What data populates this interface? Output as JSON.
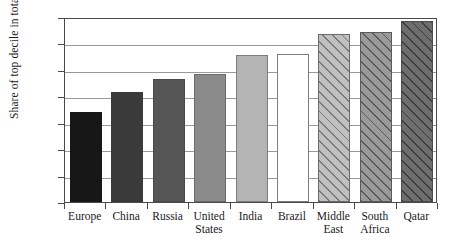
{
  "chart_data": {
    "type": "bar",
    "title": "",
    "xlabel": "",
    "ylabel": "Share of top decile in total income",
    "ylim": [
      0,
      70
    ],
    "ytick_labels": [
      "0%",
      "10%",
      "20%",
      "30%",
      "40%",
      "50%",
      "60%",
      "70%"
    ],
    "ytick_values": [
      0,
      10,
      20,
      30,
      40,
      50,
      60,
      70
    ],
    "grid": true,
    "legend": "none",
    "categories": [
      "Europe",
      "China",
      "Russia",
      "United\nStates",
      "India",
      "Brazil",
      "Middle\nEast",
      "South\nAfrica",
      "Qatar"
    ],
    "values": [
      34,
      41.5,
      46.5,
      48.5,
      55.5,
      56,
      63.5,
      64.5,
      68.5
    ],
    "bar_styles": [
      {
        "fill": "#171717",
        "border": "#171717",
        "hatch": false
      },
      {
        "fill": "#3a3a3a",
        "border": "#3a3a3a",
        "hatch": false
      },
      {
        "fill": "#565656",
        "border": "#4a4a4a",
        "hatch": false
      },
      {
        "fill": "#8a8a8a",
        "border": "#6b6b6b",
        "hatch": false
      },
      {
        "fill": "#b4b4b4",
        "border": "#7d7d7d",
        "hatch": false
      },
      {
        "fill": "#ffffff",
        "border": "#7d7d7d",
        "hatch": false
      },
      {
        "fill": "#c0c0c0",
        "border": "#6b6b6b",
        "hatch": true,
        "hatch_color": "#7a7a7a"
      },
      {
        "fill": "#9a9a9a",
        "border": "#5a5a5a",
        "hatch": true,
        "hatch_color": "#5a5a5a"
      },
      {
        "fill": "#6e6e6e",
        "border": "#4a4a4a",
        "hatch": true,
        "hatch_color": "#3c3c3c"
      }
    ]
  },
  "colors": {
    "background": "#ffffff",
    "axis": "#4a4a4a",
    "gridline": "#9a9a9a",
    "text": "#1a1a1a"
  }
}
